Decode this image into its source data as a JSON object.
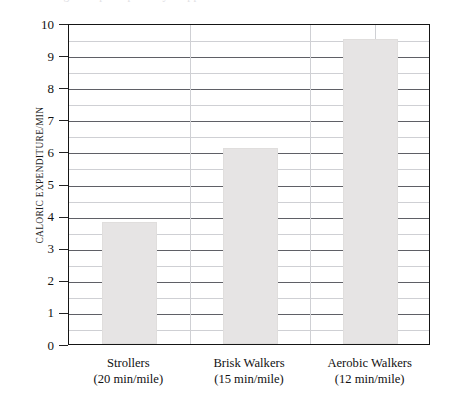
{
  "figure": {
    "cropped_caption_fragment": "figure caption partially cropped above"
  },
  "chart_data": {
    "type": "bar",
    "title": "",
    "xlabel": "",
    "ylabel": "CALORIC EXPENDITURE/MIN",
    "ylim": [
      0,
      10
    ],
    "ytick_step": 1,
    "yminor_step": 0.5,
    "grid": true,
    "legend": false,
    "categories": [
      "Strollers",
      "Brisk Walkers",
      "Aerobic Walkers"
    ],
    "category_sublabels": [
      "(20 min/mile)",
      "(15 min/mile)",
      "(12 min/mile)"
    ],
    "values": [
      3.8,
      6.1,
      9.5
    ],
    "ytick_labels": [
      "0",
      "1",
      "2",
      "3",
      "4",
      "5",
      "6",
      "7",
      "8",
      "9",
      "10"
    ],
    "bar_color": "#e6e4e4",
    "axis_color": "#151515",
    "gridline_major_color": "#5f6066",
    "gridline_minor_color": "#cfd0d4"
  }
}
